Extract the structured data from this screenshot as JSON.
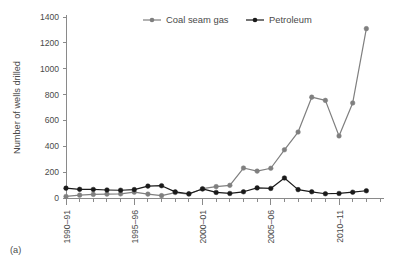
{
  "panel": {
    "label": "(a)"
  },
  "chart_data": {
    "type": "line",
    "title": "",
    "xlabel": "",
    "ylabel": "Number of wells drilled",
    "ylim": [
      0,
      1400
    ],
    "yticks": [
      0,
      200,
      400,
      600,
      800,
      1000,
      1200,
      1400
    ],
    "ytick_labels": [
      "0",
      "200",
      "400",
      "600",
      "800",
      "1000",
      "1200",
      "1400"
    ],
    "grid": false,
    "legend_position": "top-center",
    "x": [
      "1990-91",
      "1991-92",
      "1992-93",
      "1993-94",
      "1994-95",
      "1995-96",
      "1996-97",
      "1997-98",
      "1998-99",
      "1999-00",
      "2000-01",
      "2001-02",
      "2002-03",
      "2003-04",
      "2004-05",
      "2005-06",
      "2006-07",
      "2007-08",
      "2008-09",
      "2009-10",
      "2010-11",
      "2011-12",
      "2012-13",
      "2013-14"
    ],
    "xtick_labels": [
      "1990–91",
      "1995–96",
      "2000–01",
      "2005–06",
      "2010–11"
    ],
    "xtick_indices": [
      0,
      5,
      10,
      15,
      20
    ],
    "series": [
      {
        "name": "Coal seam gas",
        "color": "#7f7f7f",
        "marker": "circle",
        "values": [
          12,
          22,
          28,
          30,
          32,
          45,
          30,
          18,
          42,
          30,
          72,
          88,
          98,
          232,
          208,
          230,
          373,
          510,
          780,
          755,
          480,
          735,
          1310,
          null
        ]
      },
      {
        "name": "Petroleum",
        "color": "#1a1a1a",
        "marker": "circle",
        "values": [
          76,
          67,
          66,
          62,
          60,
          65,
          92,
          95,
          47,
          33,
          70,
          43,
          35,
          48,
          78,
          74,
          155,
          65,
          48,
          33,
          35,
          45,
          56,
          null
        ]
      }
    ]
  },
  "legend": {
    "items": [
      {
        "label": "Coal seam gas",
        "color": "#7f7f7f"
      },
      {
        "label": "Petroleum",
        "color": "#1a1a1a"
      }
    ]
  }
}
